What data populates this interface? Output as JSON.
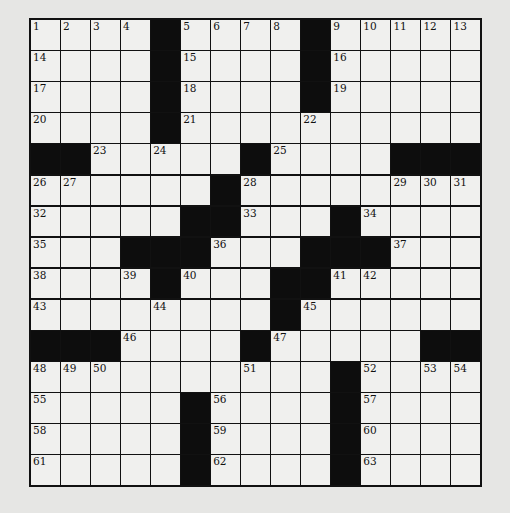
{
  "puzzle": {
    "rows": 15,
    "cols": 15,
    "layout": [
      "....#....#.....",
      "....#....#.....",
      "....#....#.....",
      "....#..........",
      "##.....#....###",
      "......#........",
      ".....##...#....",
      "...###...###...",
      "....#...##.....",
      "........#......",
      "###....#.....##",
      "..........#....",
      ".....#....#....",
      ".....#....#....",
      ".....#....#...."
    ],
    "numbers": [
      {
        "r": 0,
        "c": 0,
        "n": "1"
      },
      {
        "r": 0,
        "c": 1,
        "n": "2"
      },
      {
        "r": 0,
        "c": 2,
        "n": "3"
      },
      {
        "r": 0,
        "c": 3,
        "n": "4"
      },
      {
        "r": 0,
        "c": 5,
        "n": "5"
      },
      {
        "r": 0,
        "c": 6,
        "n": "6"
      },
      {
        "r": 0,
        "c": 7,
        "n": "7"
      },
      {
        "r": 0,
        "c": 8,
        "n": "8"
      },
      {
        "r": 0,
        "c": 10,
        "n": "9"
      },
      {
        "r": 0,
        "c": 11,
        "n": "10"
      },
      {
        "r": 0,
        "c": 12,
        "n": "11"
      },
      {
        "r": 0,
        "c": 13,
        "n": "12"
      },
      {
        "r": 0,
        "c": 14,
        "n": "13"
      },
      {
        "r": 1,
        "c": 0,
        "n": "14"
      },
      {
        "r": 1,
        "c": 5,
        "n": "15"
      },
      {
        "r": 1,
        "c": 10,
        "n": "16"
      },
      {
        "r": 2,
        "c": 0,
        "n": "17"
      },
      {
        "r": 2,
        "c": 5,
        "n": "18"
      },
      {
        "r": 2,
        "c": 10,
        "n": "19"
      },
      {
        "r": 3,
        "c": 0,
        "n": "20"
      },
      {
        "r": 3,
        "c": 5,
        "n": "21"
      },
      {
        "r": 3,
        "c": 9,
        "n": "22"
      },
      {
        "r": 4,
        "c": 2,
        "n": "23"
      },
      {
        "r": 4,
        "c": 4,
        "n": "24"
      },
      {
        "r": 4,
        "c": 8,
        "n": "25"
      },
      {
        "r": 5,
        "c": 0,
        "n": "26"
      },
      {
        "r": 5,
        "c": 1,
        "n": "27"
      },
      {
        "r": 5,
        "c": 7,
        "n": "28"
      },
      {
        "r": 5,
        "c": 12,
        "n": "29"
      },
      {
        "r": 5,
        "c": 13,
        "n": "30"
      },
      {
        "r": 5,
        "c": 14,
        "n": "31"
      },
      {
        "r": 6,
        "c": 0,
        "n": "32"
      },
      {
        "r": 6,
        "c": 7,
        "n": "33"
      },
      {
        "r": 6,
        "c": 11,
        "n": "34"
      },
      {
        "r": 7,
        "c": 0,
        "n": "35"
      },
      {
        "r": 7,
        "c": 6,
        "n": "36"
      },
      {
        "r": 7,
        "c": 12,
        "n": "37"
      },
      {
        "r": 8,
        "c": 0,
        "n": "38"
      },
      {
        "r": 8,
        "c": 3,
        "n": "39"
      },
      {
        "r": 8,
        "c": 5,
        "n": "40"
      },
      {
        "r": 8,
        "c": 10,
        "n": "41"
      },
      {
        "r": 8,
        "c": 11,
        "n": "42"
      },
      {
        "r": 9,
        "c": 0,
        "n": "43"
      },
      {
        "r": 9,
        "c": 4,
        "n": "44"
      },
      {
        "r": 9,
        "c": 9,
        "n": "45"
      },
      {
        "r": 10,
        "c": 3,
        "n": "46"
      },
      {
        "r": 10,
        "c": 8,
        "n": "47"
      },
      {
        "r": 11,
        "c": 0,
        "n": "48"
      },
      {
        "r": 11,
        "c": 1,
        "n": "49"
      },
      {
        "r": 11,
        "c": 2,
        "n": "50"
      },
      {
        "r": 11,
        "c": 7,
        "n": "51"
      },
      {
        "r": 11,
        "c": 11,
        "n": "52"
      },
      {
        "r": 11,
        "c": 13,
        "n": "53"
      },
      {
        "r": 11,
        "c": 14,
        "n": "54"
      },
      {
        "r": 12,
        "c": 0,
        "n": "55"
      },
      {
        "r": 12,
        "c": 6,
        "n": "56"
      },
      {
        "r": 12,
        "c": 11,
        "n": "57"
      },
      {
        "r": 13,
        "c": 0,
        "n": "58"
      },
      {
        "r": 13,
        "c": 6,
        "n": "59"
      },
      {
        "r": 13,
        "c": 11,
        "n": "60"
      },
      {
        "r": 14,
        "c": 0,
        "n": "61"
      },
      {
        "r": 14,
        "c": 6,
        "n": "62"
      },
      {
        "r": 14,
        "c": 11,
        "n": "63"
      }
    ],
    "letters": []
  },
  "colors": {
    "paper": "#e6e6e4",
    "cell": "#f0f0ee",
    "block": "#0d0d0d",
    "ink": "#111111"
  }
}
